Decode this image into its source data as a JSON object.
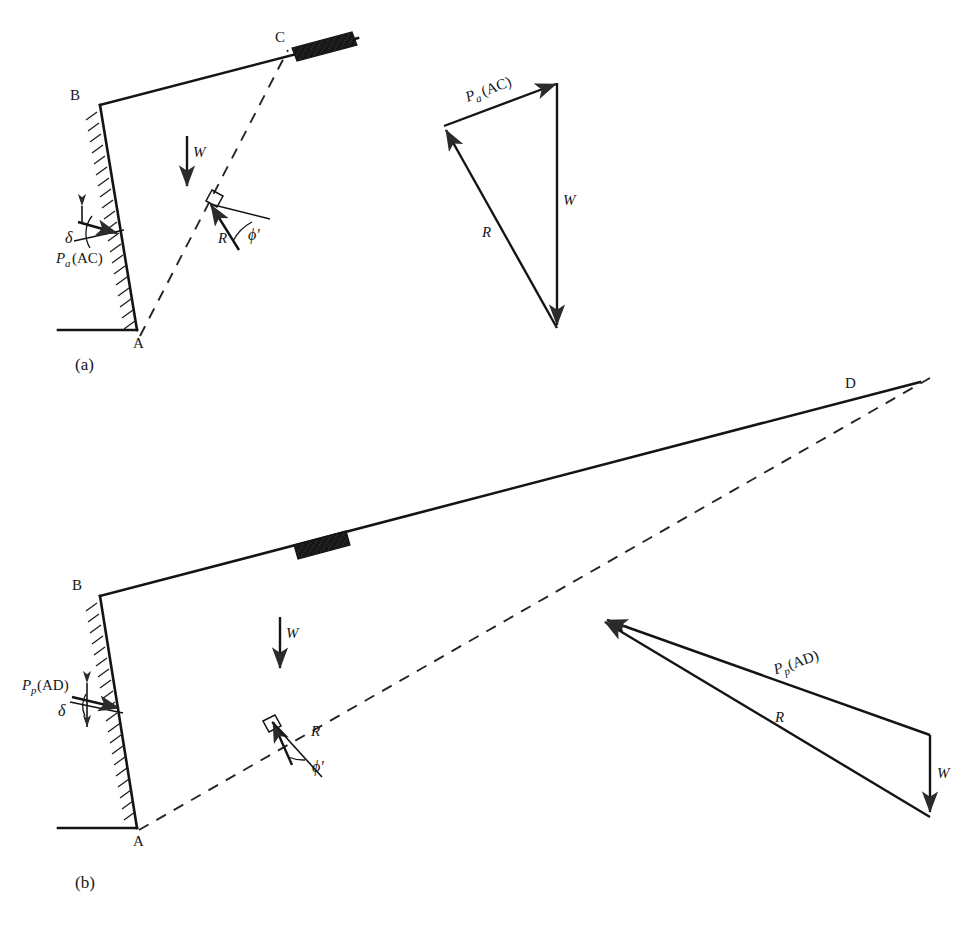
{
  "figure": {
    "caption_partial": "",
    "panels": [
      {
        "id": "a",
        "panel_label": "(a)",
        "kind": "active-earth-pressure",
        "points": [
          {
            "name": "A",
            "label": "A"
          },
          {
            "name": "B",
            "label": "B"
          },
          {
            "name": "C",
            "label": "C"
          }
        ],
        "force_labels": {
          "weight": "W",
          "reaction": "R",
          "friction_angle": "ϕ'",
          "wall_friction_angle": "δ",
          "pressure_main": "P",
          "pressure_sub": "a",
          "pressure_arg": "(AC)"
        },
        "vector_diagram": {
          "weight": "W",
          "reaction": "R",
          "pressure_main": "P",
          "pressure_sub": "a",
          "pressure_arg": "(AC)"
        }
      },
      {
        "id": "b",
        "panel_label": "(b)",
        "kind": "passive-earth-pressure",
        "points": [
          {
            "name": "A",
            "label": "A"
          },
          {
            "name": "B",
            "label": "B"
          },
          {
            "name": "D",
            "label": "D"
          }
        ],
        "force_labels": {
          "weight": "W",
          "reaction": "R",
          "friction_angle": "ϕ'",
          "wall_friction_angle": "δ",
          "pressure_main": "P",
          "pressure_sub": "p",
          "pressure_arg": "(AD)"
        },
        "vector_diagram": {
          "weight": "W",
          "reaction": "R",
          "pressure_main": "P",
          "pressure_sub": "p",
          "pressure_arg": "(AD)"
        }
      }
    ]
  }
}
